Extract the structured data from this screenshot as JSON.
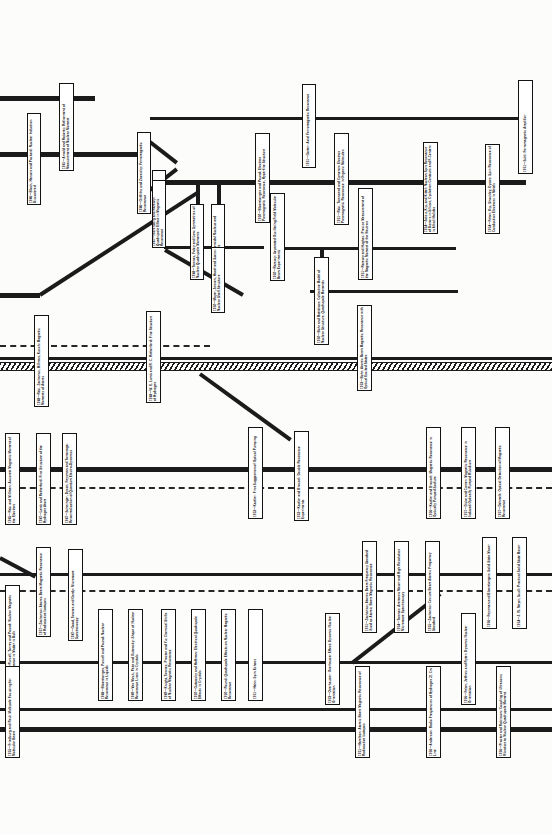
{
  "document": {
    "kind": "history-flow-chart",
    "subject": "Development of magnetic resonance, 1938-1956",
    "orientation": "landscape-chart-rotated-90deg",
    "width": 552,
    "height": 835,
    "background_color": "#fcfcfa",
    "line_color": "#1b1b1b",
    "box_fill": "#ffffff",
    "box_border": "#131313"
  },
  "nodes": [
    {
      "id": "n01",
      "year": "1941",
      "title": "Arnold and Roberts: Refinement of Measurement of Nuclear Moment",
      "x": 59,
      "y": 83,
      "w": 15,
      "h": 88
    },
    {
      "id": "n02",
      "year": "1946",
      "title": "Bloch, Hansen and Packard: Nuclear Induction Discovered",
      "x": 27,
      "y": 113,
      "w": 14,
      "h": 92
    },
    {
      "id": "n03",
      "year": "1946",
      "title": "Griffiths and Zavoisky: Ferromagnetic Resonance",
      "x": 137,
      "y": 132,
      "w": 14,
      "h": 82
    },
    {
      "id": "n04",
      "year": "1946",
      "title": "Garwin: Nucleon Free Magnetic Resonance",
      "x": 152,
      "y": 170,
      "w": 14,
      "h": 78
    },
    {
      "id": "n05",
      "year": "1947",
      "title": "Nierenberg and Ramsey: Quadrupole Effect in Magnetic Resonance",
      "x": 152,
      "y": 180,
      "w": 14,
      "h": 68
    },
    {
      "id": "n06",
      "year": "1950",
      "title": "Bloembergen and Pound: Electron Paramagnetic Resonance, Hyperfine Structure",
      "x": 255,
      "y": 133,
      "w": 15,
      "h": 90
    },
    {
      "id": "n07",
      "year": "1948",
      "title": "Townes, Foley and Low: Symmetries of Nuclear Quadrupole Moments",
      "x": 190,
      "y": 204,
      "w": 14,
      "h": 76
    },
    {
      "id": "n08",
      "year": "1950",
      "title": "Ramsey: Spheroidal Nucleus and Quadrupole Moments",
      "x": 211,
      "y": 204,
      "w": 14,
      "h": 76
    },
    {
      "id": "n09",
      "year": "1950",
      "title": "Mayer, Jensen, Haxel and Suess: Nuclear Shell Structure",
      "x": 211,
      "y": 247,
      "w": 14,
      "h": 66
    },
    {
      "id": "n10",
      "year": "1950",
      "title": "Bohr and Mottelson: Collective Model of Nuclear Structure, Quadrupole Moments",
      "x": 314,
      "y": 257,
      "w": 15,
      "h": 88
    },
    {
      "id": "n11",
      "year": "1951",
      "title": "Gorter: Axial Ferromagnetic Resonance",
      "x": 302,
      "y": 84,
      "w": 14,
      "h": 84
    },
    {
      "id": "n12",
      "year": "1951",
      "title": "Suhl: Ferromagnetic Amplifier",
      "x": 518,
      "y": 80,
      "w": 15,
      "h": 94
    },
    {
      "id": "n13",
      "year": "1951",
      "title": "Rabi, Townsend and Cameron: Electron Paramagnetic Resonance in Organic Molecules",
      "x": 334,
      "y": 133,
      "w": 15,
      "h": 92
    },
    {
      "id": "n14",
      "year": "1954",
      "title": "Jaksu, Kip, and Kittel: Nucleon Spin Resonance of Donors in Silicon, Cyclotron Contours and F-Centers in Alkali Halides",
      "x": 423,
      "y": 142,
      "w": 15,
      "h": 92
    },
    {
      "id": "n15",
      "year": "1954",
      "title": "Feher, Kip, Shockley, Dyson: Spin Resonance of Conduction Electrons in Metals",
      "x": 485,
      "y": 144,
      "w": 15,
      "h": 90
    },
    {
      "id": "n16",
      "year": "1950",
      "title": "Ramsey: Separated Oscillating Field Molecular Beam Experiments",
      "x": 270,
      "y": 193,
      "w": 15,
      "h": 88
    },
    {
      "id": "n17",
      "year": "1951",
      "title": "Ramsey and Hughes: Precise Measurement of the Magnetic Moment of the Neutron",
      "x": 358,
      "y": 188,
      "w": 15,
      "h": 92
    },
    {
      "id": "n18",
      "year": "1953",
      "title": "Bohr: Atomic Beam Magnetic Resonance with Optical Excited States",
      "x": 357,
      "y": 305,
      "w": 15,
      "h": 86
    },
    {
      "id": "n19",
      "year": "1948",
      "title": "Rabi, Zacharias, Millman, Kusch: Magnetic Moments of Atoms",
      "x": 34,
      "y": 315,
      "w": 15,
      "h": 92
    },
    {
      "id": "n20",
      "year": "1948",
      "title": "W. E. Lamb and R. C. Retherford: Fine Structure of Hydrogen",
      "x": 146,
      "y": 311,
      "w": 15,
      "h": 92
    },
    {
      "id": "n21",
      "year": "1945",
      "title": "Rabi and Millman: Accurate Magnetic Moment of the Electron",
      "x": 5,
      "y": 433,
      "w": 15,
      "h": 92
    },
    {
      "id": "n22",
      "year": "1947",
      "title": "Lamb and Retherford: Fine Structure of the Hydrogen Atom",
      "x": 36,
      "y": 433,
      "w": 15,
      "h": 92
    },
    {
      "id": "n23",
      "year": "1947",
      "title": "Schwinger, Dyson, Feynman and Tomonaga: Renormalization of Quantum Electro-Dynamics",
      "x": 62,
      "y": 433,
      "w": 15,
      "h": 92
    },
    {
      "id": "n24",
      "year": "1952",
      "title": "Kastler: First Suggestion of Optical Pumping",
      "x": 248,
      "y": 427,
      "w": 15,
      "h": 92
    },
    {
      "id": "n25",
      "year": "1952",
      "title": "Kastler and Brossel: Double Resonance Experiments",
      "x": 294,
      "y": 431,
      "w": 15,
      "h": 90
    },
    {
      "id": "n26",
      "year": "1956",
      "title": "Kastler and Brossel: Magnetic Resonance in Optically Pumped Sodium",
      "x": 426,
      "y": 427,
      "w": 15,
      "h": 92
    },
    {
      "id": "n27",
      "year": "1957",
      "title": "Dicke and Carver: Magnetic Resonance in Induced Optically Pumped Rubidium",
      "x": 461,
      "y": 427,
      "w": 15,
      "h": 92
    },
    {
      "id": "n28",
      "year": "1957",
      "title": "Dehmelt: Optical Detection of Magnetic Resonance",
      "x": 495,
      "y": 427,
      "w": 15,
      "h": 92
    },
    {
      "id": "n29",
      "year": "1957",
      "title": "Zacharias: Atomic Beam Magnetic Resonance of Radioactive Isotopes",
      "x": 36,
      "y": 547,
      "w": 15,
      "h": 90
    },
    {
      "id": "n30",
      "year": "1947",
      "title": "Good, Townes and Gordy: Microwave Spectroscopy",
      "x": 68,
      "y": 549,
      "w": 15,
      "h": 92
    },
    {
      "id": "n31",
      "year": "1956",
      "title": "Purcell, Torrey and Pound: Nuclear Magnetic Resonance in Matter in Bulk",
      "x": 5,
      "y": 585,
      "w": 15,
      "h": 92
    },
    {
      "id": "n32",
      "year": "1948",
      "title": "Bloembergen, Purcell and Pound: Nuclear Resonance in Liquids",
      "x": 98,
      "y": 609,
      "w": 15,
      "h": 92
    },
    {
      "id": "n33",
      "year": "1949",
      "title": "Van Vleck, Pake and Gutowsky: Shape of Nuclear Resonance Lines in Crystals",
      "x": 128,
      "y": 609,
      "w": 15,
      "h": 92
    },
    {
      "id": "n34",
      "year": "1949",
      "title": "Knight, Townes, Proctor and Yu: Chemical Shifts of Nuclear Magnetic Resonance",
      "x": 161,
      "y": 609,
      "w": 15,
      "h": 92
    },
    {
      "id": "n35",
      "year": "1950",
      "title": "Gutowsky and Hoffman: Electrical Quadrupole Effects in Crystals",
      "x": 191,
      "y": 609,
      "w": 15,
      "h": 92
    },
    {
      "id": "n36",
      "year": "1950",
      "title": "Pound: Quadrupole Effects on Nuclear Magnetic Resonance",
      "x": 221,
      "y": 609,
      "w": 15,
      "h": 92
    },
    {
      "id": "n37",
      "year": "1951",
      "title": "Hahn: Spin Echoes",
      "x": 248,
      "y": 609,
      "w": 15,
      "h": 92
    },
    {
      "id": "n38",
      "year": "1951",
      "title": "Zacharias: Atomic Beam Frequency Standard Used as Atomic Beam Magnetic Resonance",
      "x": 362,
      "y": 541,
      "w": 15,
      "h": 92
    },
    {
      "id": "n39",
      "year": "1954",
      "title": "Townes: Ammonia Maser and High Resolution Microwave Spectroscopy",
      "x": 394,
      "y": 541,
      "w": 15,
      "h": 92
    },
    {
      "id": "n40",
      "year": "1955",
      "title": "Zacharias: Cesium Beam Atomic Frequency Standard",
      "x": 425,
      "y": 541,
      "w": 15,
      "h": 92
    },
    {
      "id": "n41",
      "year": "1956",
      "title": "Feynman and Bloembergen: Solid State Maser",
      "x": 482,
      "y": 537,
      "w": 15,
      "h": 92
    },
    {
      "id": "n42",
      "year": "1954",
      "title": "J. W. Meyer, Scull: Practical Solid State Maser",
      "x": 512,
      "y": 537,
      "w": 15,
      "h": 92
    },
    {
      "id": "n43",
      "year": "1953",
      "title": "Overhauser: Overhauser Effect: Dynamic Nuclear Orientation",
      "x": 325,
      "y": 613,
      "w": 15,
      "h": 92
    },
    {
      "id": "n44",
      "year": "1955",
      "title": "Friedburg and Paul: Multipole Focusing for Molecular Beam",
      "x": 5,
      "y": 666,
      "w": 15,
      "h": 92
    },
    {
      "id": "n45",
      "year": "1951",
      "title": "Hamilton: Atomic Beam Magnetic Resonance of Radioactive Isotopes",
      "x": 355,
      "y": 666,
      "w": 15,
      "h": 92
    },
    {
      "id": "n46",
      "year": "1956",
      "title": "Anderson: Radio Frequencies of Hydrogen 21 Cm Line",
      "x": 426,
      "y": 666,
      "w": 15,
      "h": 92
    },
    {
      "id": "n47",
      "year": "1956",
      "title": "Feher, Jeffries and Ryter: Dynamic Nuclear Orientation",
      "x": 461,
      "y": 613,
      "w": 15,
      "h": 92
    },
    {
      "id": "n48",
      "year": "1956",
      "title": "Proctor and Robinson: Coupling of Ultrasonic Vibration to Nuclear Quadrupole Moment",
      "x": 496,
      "y": 666,
      "w": 15,
      "h": 92
    }
  ],
  "rails": [
    {
      "id": "r01",
      "x": 0,
      "y": 96,
      "w": 95,
      "t": "thick"
    },
    {
      "id": "r02",
      "x": 0,
      "y": 152,
      "w": 140,
      "t": "thick"
    },
    {
      "id": "r03",
      "x": 150,
      "y": 117,
      "w": 375,
      "t": "thin"
    },
    {
      "id": "r04",
      "x": 164,
      "y": 180,
      "w": 98,
      "t": "thick"
    },
    {
      "id": "r05",
      "x": 268,
      "y": 180,
      "w": 258,
      "t": "thick"
    },
    {
      "id": "r06",
      "x": 164,
      "y": 246,
      "w": 100,
      "t": "thin"
    },
    {
      "id": "r07",
      "x": 276,
      "y": 247,
      "w": 180,
      "t": "thin"
    },
    {
      "id": "r08",
      "x": 0,
      "y": 293,
      "w": 40,
      "t": "thick"
    },
    {
      "id": "r09",
      "x": 310,
      "y": 290,
      "w": 148,
      "t": "thin"
    },
    {
      "id": "r10",
      "x": 0,
      "y": 357,
      "w": 552,
      "t": "thin"
    },
    {
      "id": "r11",
      "x": 0,
      "y": 467,
      "w": 260,
      "t": "thick"
    },
    {
      "id": "r12",
      "x": 258,
      "y": 467,
      "w": 294,
      "t": "thick"
    },
    {
      "id": "r13",
      "x": 0,
      "y": 573,
      "w": 552,
      "t": "thin"
    },
    {
      "id": "r14",
      "x": 0,
      "y": 661,
      "w": 552,
      "t": "thin"
    },
    {
      "id": "r15",
      "x": 0,
      "y": 727,
      "w": 552,
      "t": "thick"
    },
    {
      "id": "r16",
      "x": 0,
      "y": 708,
      "w": 552,
      "t": "thin"
    }
  ],
  "dashed_rails": [
    {
      "id": "d01",
      "x": 0,
      "y": 345,
      "w": 210
    },
    {
      "id": "d02",
      "x": 0,
      "y": 487,
      "w": 552
    },
    {
      "id": "d03",
      "x": 0,
      "y": 590,
      "w": 552
    }
  ],
  "hatched_bands": [
    {
      "id": "h01",
      "x": 0,
      "y": 362,
      "w": 552
    }
  ],
  "diagonals": [
    {
      "id": "g01",
      "x": 150,
      "y": 140,
      "len": 34,
      "angle": 38
    },
    {
      "id": "g02",
      "x": 150,
      "y": 188,
      "len": 34,
      "angle": -38
    },
    {
      "id": "g03",
      "x": 40,
      "y": 293,
      "len": 188,
      "angle": -33
    },
    {
      "id": "g04",
      "x": 200,
      "y": 372,
      "len": 112,
      "angle": 36
    },
    {
      "id": "g05",
      "x": 0,
      "y": 556,
      "w": 0,
      "len": 40,
      "angle": 28
    },
    {
      "id": "g06",
      "x": 352,
      "y": 661,
      "len": 112,
      "angle": -38
    },
    {
      "id": "g07",
      "x": 165,
      "y": 248,
      "len": 90,
      "angle": 30
    }
  ],
  "vertical_stubs": [
    {
      "id": "v01",
      "x": 196,
      "y": 180,
      "h": 66
    },
    {
      "id": "v02",
      "x": 217,
      "y": 180,
      "h": 66
    },
    {
      "id": "v03",
      "x": 320,
      "y": 247,
      "h": 44
    },
    {
      "id": "v04",
      "x": 254,
      "y": 467,
      "h": 22
    },
    {
      "id": "v05",
      "x": 74,
      "y": 573,
      "h": 18
    },
    {
      "id": "v06",
      "x": 368,
      "y": 573,
      "h": 18
    },
    {
      "id": "v07",
      "x": 432,
      "y": 573,
      "h": 18
    }
  ]
}
